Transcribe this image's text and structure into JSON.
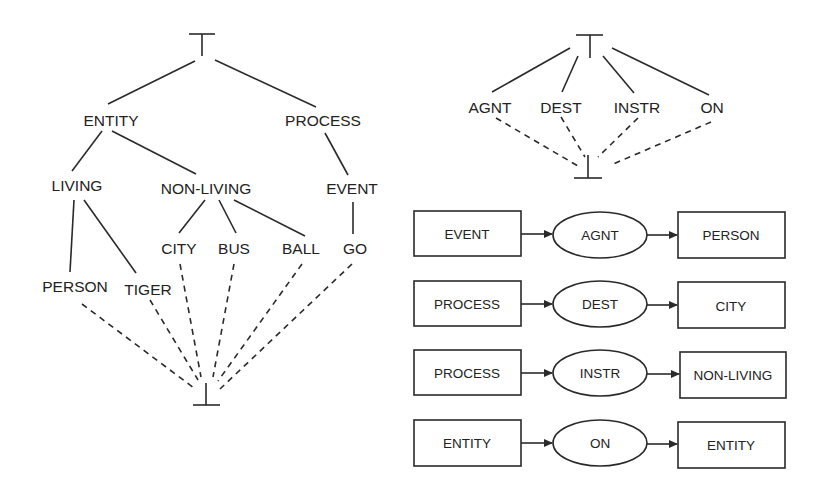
{
  "colors": {
    "ink": "#222222",
    "background": "#ffffff"
  },
  "type_hierarchy": {
    "top_symbol": "⊤",
    "bottom_symbol": "⊥",
    "nodes": {
      "entity": "ENTITY",
      "process": "PROCESS",
      "living": "LIVING",
      "non_living": "NON-LIVING",
      "event": "EVENT",
      "city": "CITY",
      "bus": "BUS",
      "ball": "BALL",
      "go": "GO",
      "person": "PERSON",
      "tiger": "TIGER"
    },
    "edges": [
      [
        "TOP",
        "ENTITY"
      ],
      [
        "TOP",
        "PROCESS"
      ],
      [
        "ENTITY",
        "LIVING"
      ],
      [
        "ENTITY",
        "NON-LIVING"
      ],
      [
        "PROCESS",
        "EVENT"
      ],
      [
        "LIVING",
        "PERSON"
      ],
      [
        "LIVING",
        "TIGER"
      ],
      [
        "NON-LIVING",
        "CITY"
      ],
      [
        "NON-LIVING",
        "BUS"
      ],
      [
        "NON-LIVING",
        "BALL"
      ],
      [
        "EVENT",
        "GO"
      ]
    ],
    "dashed_to_bottom": [
      "PERSON",
      "TIGER",
      "CITY",
      "BUS",
      "BALL",
      "GO"
    ]
  },
  "relation_hierarchy": {
    "top_symbol": "⊤",
    "bottom_symbol": "⊥",
    "nodes": {
      "agnt": "AGNT",
      "dest": "DEST",
      "instr": "INSTR",
      "on": "ON"
    }
  },
  "relation_signatures": [
    {
      "source": "EVENT",
      "relation": "AGNT",
      "target": "PERSON"
    },
    {
      "source": "PROCESS",
      "relation": "DEST",
      "target": "CITY"
    },
    {
      "source": "PROCESS",
      "relation": "INSTR",
      "target": "NON-LIVING"
    },
    {
      "source": "ENTITY",
      "relation": "ON",
      "target": "ENTITY"
    }
  ]
}
